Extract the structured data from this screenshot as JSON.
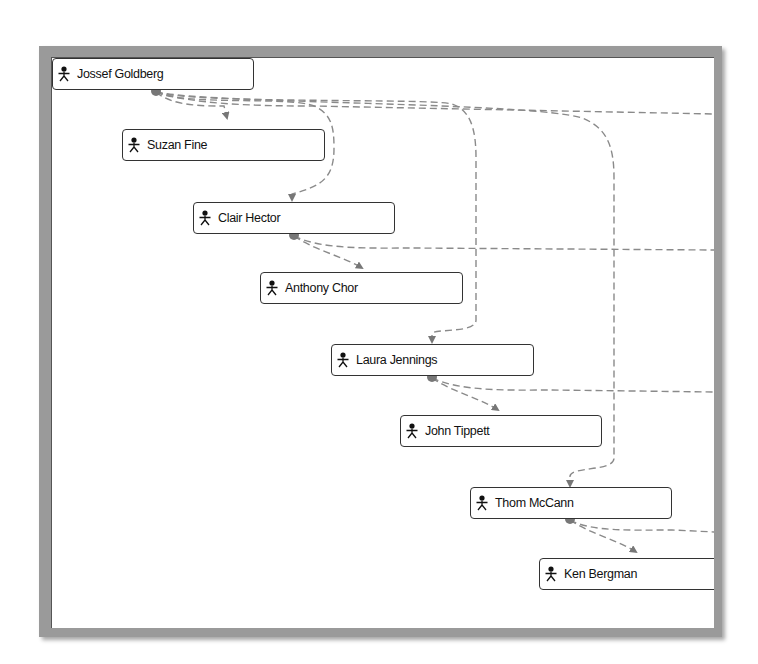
{
  "diagram": {
    "type": "org-hierarchy",
    "node_icon": "actor-icon",
    "colors": {
      "link": "#8a8a8a",
      "node_border": "#333333",
      "frame": "#9a9a9a",
      "connector_dot": "#777777"
    },
    "nodes": [
      {
        "id": "jossef",
        "label": "Jossef Goldberg"
      },
      {
        "id": "suzan",
        "label": "Suzan Fine"
      },
      {
        "id": "clair",
        "label": "Clair Hector"
      },
      {
        "id": "anthony",
        "label": "Anthony Chor"
      },
      {
        "id": "laura",
        "label": "Laura Jennings"
      },
      {
        "id": "john",
        "label": "John Tippett"
      },
      {
        "id": "thom",
        "label": "Thom McCann"
      },
      {
        "id": "ken",
        "label": "Ken Bergman"
      }
    ],
    "links": [
      {
        "from": "jossef",
        "to": "suzan"
      },
      {
        "from": "jossef",
        "to": "clair"
      },
      {
        "from": "jossef",
        "to": "laura"
      },
      {
        "from": "jossef",
        "to": "thom"
      },
      {
        "from": "clair",
        "to": "anthony"
      },
      {
        "from": "laura",
        "to": "john"
      },
      {
        "from": "thom",
        "to": "ken"
      }
    ]
  }
}
